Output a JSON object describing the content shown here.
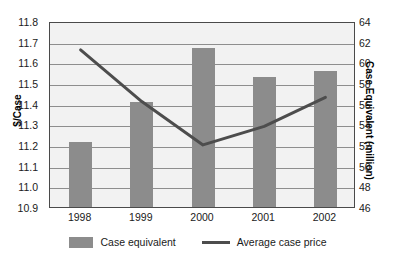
{
  "chart_data": {
    "type": "bar",
    "title": "",
    "subtitle": "",
    "xlabel": "",
    "categories": [
      "1998",
      "1999",
      "2000",
      "2001",
      "2002"
    ],
    "grid": true,
    "legend_position": "bottom",
    "axes": {
      "left": {
        "label": "$/Case",
        "ylim": [
          10.9,
          11.8
        ],
        "tick_step": 0.1,
        "ticks": [
          "11.8",
          "11.7",
          "11.6",
          "11.5",
          "11.4",
          "11.3",
          "11.2",
          "11.1",
          "11.0",
          "10.9"
        ]
      },
      "right": {
        "label": "Case Equivalent (million)",
        "ylim": [
          46,
          64
        ],
        "tick_step": 2,
        "ticks": [
          "64",
          "62",
          "60",
          "58",
          "56",
          "54",
          "52",
          "50",
          "48",
          "46"
        ]
      }
    },
    "series": [
      {
        "name": "Case equivalent",
        "kind": "bar",
        "axis": "right",
        "color": "#8c8c8c",
        "values": [
          52.3,
          56.2,
          61.4,
          58.6,
          59.2
        ]
      },
      {
        "name": "Average case price",
        "kind": "line",
        "axis": "left",
        "color": "#4d4d4d",
        "values": [
          11.67,
          11.42,
          11.21,
          11.3,
          11.44
        ]
      }
    ]
  },
  "legend": {
    "items": [
      {
        "label": "Case equivalent",
        "marker": "swatch"
      },
      {
        "label": "Average case price",
        "marker": "line"
      }
    ]
  },
  "colors": {
    "bar": "#8c8c8c",
    "line": "#4d4d4d",
    "plot_background": "#f2f2f2",
    "grid": "#8e8e8e",
    "frame": "#4a4a4a",
    "text": "#1a1a1a"
  }
}
